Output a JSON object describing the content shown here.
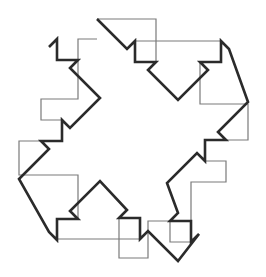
{
  "figure": {
    "kind": "geometric-line-drawing",
    "background_color": "#ffffff",
    "canvas": {
      "width": 266,
      "height": 277
    },
    "shapes": [
      {
        "name": "diagonal-cross-polygon",
        "role": "bold-foreground-outline",
        "stroke_color": "#2b2b2b",
        "stroke_width": 2.6,
        "fill": "none",
        "vertex_count": 24,
        "points": "97,19 127,49 135,41 135,62 156,62 148,70 178,100 208,70 200,62 221,62 221,41 229,49 248,102 218,132 226,140 205,140 205,161 197,153 167,183 178,213 170,221 191,221 191,242 199,234 178,261 148,231 140,239 140,218 119,218 127,210 100,181 70,211 78,219 57,219 57,240 49,232 19,179 49,149 41,141 62,141 62,120 70,128 100,98 70,68 78,60 57,60 57,39 49,47"
      },
      {
        "name": "stepped-axis-aligned-cross-polygon",
        "role": "thin-background-outline",
        "stroke_color": "#7a7a7a",
        "stroke_width": 1.2,
        "fill": "none",
        "vertex_count": 36,
        "points": "97,19 156,19 156,62 135,62 135,41 221,41 221,62 200,62 200,104 248,104 248,140 205,140 205,161 226,161 226,182 191,182 191,242 170,242 170,221 148,221 148,258 119,258 119,218 140,218 140,239 57,239 57,219 78,219 78,175 19,175 19,141 62,141 62,120 41,120 41,99 78,99 78,39 97,39"
      }
    ],
    "extremes": {
      "top_apex": {
        "x": 97,
        "y": 19
      },
      "right_apex": {
        "x": 248,
        "y": 102
      },
      "bottom_apex": {
        "x": 178,
        "y": 261
      },
      "left_apex": {
        "x": 19,
        "y": 179
      }
    }
  }
}
